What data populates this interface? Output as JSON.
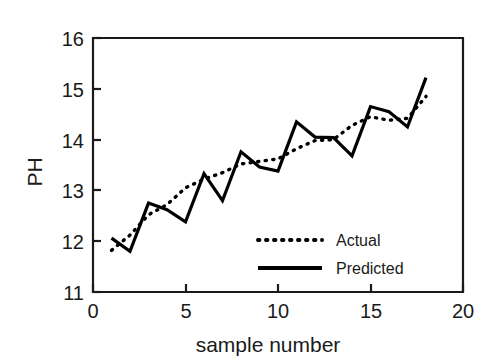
{
  "chart_data": {
    "type": "line",
    "title": "",
    "xlabel": "sample number",
    "ylabel": "PH",
    "xlim": [
      0,
      20
    ],
    "ylim": [
      11,
      16
    ],
    "xticks": [
      0,
      5,
      10,
      15,
      20
    ],
    "yticks": [
      11,
      12,
      13,
      14,
      15,
      16
    ],
    "xtick_labels": [
      "0",
      "5",
      "10",
      "15",
      "20"
    ],
    "ytick_labels": [
      "11",
      "12",
      "13",
      "14",
      "15",
      "16"
    ],
    "grid": false,
    "legend_position": "lower right inside",
    "x": [
      1,
      2,
      3,
      4,
      5,
      6,
      7,
      8,
      9,
      10,
      11,
      12,
      13,
      14,
      15,
      16,
      17,
      18
    ],
    "series": [
      {
        "name": "Actual",
        "style": "dotted",
        "color": "#000000",
        "values": [
          11.82,
          12.12,
          12.52,
          12.72,
          13.05,
          13.22,
          13.35,
          13.52,
          13.57,
          13.62,
          13.82,
          13.98,
          14.0,
          14.28,
          14.45,
          14.38,
          14.42,
          14.85
        ]
      },
      {
        "name": "Predicted",
        "style": "solid",
        "color": "#000000",
        "values": [
          12.06,
          11.8,
          12.75,
          12.62,
          12.38,
          13.33,
          12.8,
          13.76,
          13.46,
          13.38,
          14.35,
          14.05,
          14.04,
          13.68,
          14.65,
          14.55,
          14.25,
          15.22
        ]
      }
    ]
  },
  "axes": {
    "y_title": "PH",
    "x_title": "sample number"
  },
  "legend": {
    "entries": [
      {
        "label": "Actual",
        "style": "dotted"
      },
      {
        "label": "Predicted",
        "style": "solid"
      }
    ]
  }
}
